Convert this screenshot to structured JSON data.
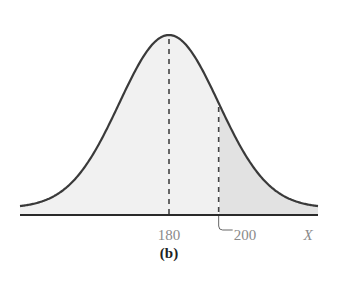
{
  "chart_data": {
    "type": "area",
    "title": "",
    "panel_label": "(b)",
    "xlabel": "X",
    "ylabel": "",
    "distribution": "normal",
    "mean": 180,
    "std": 20,
    "xlim": [
      130,
      250
    ],
    "reference_lines": [
      {
        "x": 180,
        "label": "180",
        "style": "dashed"
      },
      {
        "x": 200,
        "label": "200",
        "style": "dashed",
        "leader": true
      }
    ],
    "shaded_regions": [
      {
        "from": 130,
        "to": 200,
        "shade": "light"
      },
      {
        "from": 200,
        "to": 250,
        "shade": "darker"
      }
    ],
    "grid": false,
    "legend": "none"
  },
  "colors": {
    "curve": "#3a3a3a",
    "axis": "#2a2a2a",
    "fill_light": "#f1f1f1",
    "fill_dark": "#e2e2e2",
    "dash": "#444444"
  }
}
